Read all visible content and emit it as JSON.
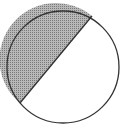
{
  "figure": {
    "shaded_region": "minor-segment",
    "colors": {
      "outline": "#333333",
      "shade_fill": "#b8b8b8",
      "shade_dot": "#7a7a7a",
      "background": "#ffffff"
    }
  }
}
